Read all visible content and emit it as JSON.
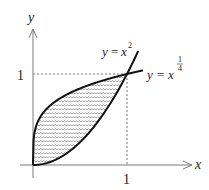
{
  "diagram": {
    "axes": {
      "x_label": "x",
      "y_label": "y",
      "x_tick_label": "1",
      "y_tick_label": "1"
    },
    "curves": [
      {
        "name": "y = x^2",
        "label_lhs": "y",
        "label_eq": "=",
        "label_base": "x",
        "label_exp": "2"
      },
      {
        "name": "y = x^(1/4)",
        "label_lhs": "y",
        "label_eq": "=",
        "label_base": "x",
        "label_exp_num": "1",
        "label_exp_den": "4"
      }
    ],
    "shaded_region": {
      "description": "Region between y = x^(1/4) (upper) and y = x^2 (lower) for 0 <= x <= 1",
      "x_range": [
        0,
        1
      ],
      "pattern": "wavy-hatch",
      "pattern_color": "#8a8a8a"
    },
    "intersection_points": [
      [
        0,
        0
      ],
      [
        1,
        1
      ]
    ],
    "colors": {
      "curve": "#111111",
      "axis": "#7a7a7a",
      "guide": "#555555"
    }
  }
}
